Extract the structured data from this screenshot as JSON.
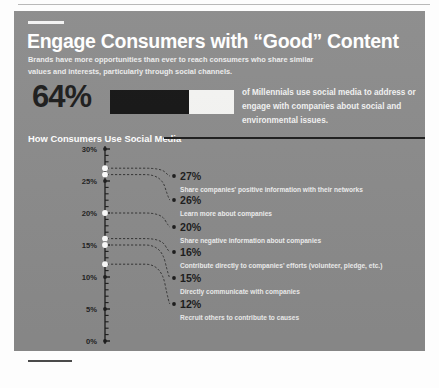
{
  "header": {
    "title": "Engage Consumers with “Good” Content",
    "subtitle": "Brands have more opportunities than ever to reach consumers who share similar values and interests, particularly through social channels."
  },
  "stat": {
    "value_label": "64%",
    "value": 64,
    "caption": "of Millennials use social media to address or engage with companies about social and environmental issues.",
    "fill_color": "#151515",
    "track_color": "#f4f4f2"
  },
  "section": {
    "title": "How Consumers Use Social Media"
  },
  "chart_data": {
    "type": "bar",
    "title": "How Consumers Use Social Media",
    "xlabel": "",
    "ylabel": "",
    "ylim": [
      0,
      30
    ],
    "ytick_labels": [
      "30%",
      "25%",
      "20%",
      "15%",
      "10%",
      "5%",
      "0%"
    ],
    "yticks": [
      30,
      25,
      20,
      15,
      10,
      5,
      0
    ],
    "grid": false,
    "legend": "none",
    "categories": [
      "Share companies' positive information with their networks",
      "Learn more about companies",
      "Share negative information about companies",
      "Contribute directly to companies' efforts (volunteer, pledge, etc.)",
      "Directly communicate with companies",
      "Recruit others to contribute to causes"
    ],
    "values": [
      27,
      26,
      20,
      16,
      15,
      12
    ],
    "value_labels": [
      "27%",
      "26%",
      "20%",
      "16%",
      "15%",
      "12%"
    ],
    "points": [
      {
        "value_label": "27%",
        "value": 27,
        "description": "Share companies' positive information with their networks"
      },
      {
        "value_label": "26%",
        "value": 26,
        "description": "Learn more about companies"
      },
      {
        "value_label": "20%",
        "value": 20,
        "description": "Share negative information about companies"
      },
      {
        "value_label": "16%",
        "value": 16,
        "description": "Contribute directly to companies' efforts (volunteer, pledge, etc.)"
      },
      {
        "value_label": "15%",
        "value": 15,
        "description": "Directly communicate with companies"
      },
      {
        "value_label": "12%",
        "value": 12,
        "description": "Recruit others to contribute to causes"
      }
    ],
    "colors": {
      "panel": "#8b8b8b",
      "axis": "#1d1d1d",
      "marker": "#ffffff",
      "label_text": "#1c1c1c",
      "desc_text": "#efefef"
    }
  }
}
